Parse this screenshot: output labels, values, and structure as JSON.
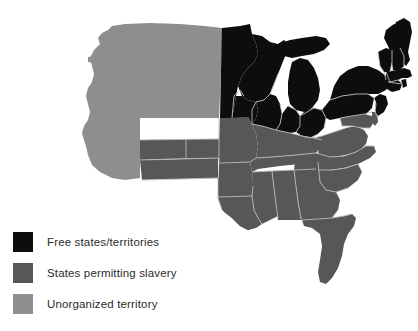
{
  "figure": {
    "kind": "thematic-map",
    "region": "eastern-united-states",
    "background_color": "#ffffff",
    "border_color": "#b9b9b9"
  },
  "legend": {
    "items": [
      {
        "key": "free",
        "label": "Free states/territories",
        "color": "#0d0d0d",
        "swatch_name": "legend-swatch-free-states"
      },
      {
        "key": "slave",
        "label": "States permitting slavery",
        "color": "#575757",
        "swatch_name": "legend-swatch-slave-states"
      },
      {
        "key": "unorganized",
        "label": "Unorganized territory",
        "color": "#8e8e8e",
        "swatch_name": "legend-swatch-unorganized-territory"
      }
    ]
  },
  "map_data": {
    "categories": [
      "Free states/territories",
      "States permitting slavery",
      "Unorganized territory"
    ],
    "colors": {
      "free": "#0d0d0d",
      "slave": "#575757",
      "unorganized": "#8e8e8e"
    },
    "regions": [
      {
        "name": "unorganized-territory-west",
        "category": "unorganized"
      },
      {
        "name": "minnesota-territory",
        "category": "free"
      },
      {
        "name": "wisconsin",
        "category": "free"
      },
      {
        "name": "michigan",
        "category": "free"
      },
      {
        "name": "iowa",
        "category": "free"
      },
      {
        "name": "illinois",
        "category": "free"
      },
      {
        "name": "indiana",
        "category": "free"
      },
      {
        "name": "ohio",
        "category": "free"
      },
      {
        "name": "pennsylvania",
        "category": "free"
      },
      {
        "name": "new-york",
        "category": "free"
      },
      {
        "name": "new-jersey",
        "category": "free"
      },
      {
        "name": "connecticut",
        "category": "free"
      },
      {
        "name": "rhode-island",
        "category": "free"
      },
      {
        "name": "massachusetts",
        "category": "free"
      },
      {
        "name": "vermont",
        "category": "free"
      },
      {
        "name": "new-hampshire",
        "category": "free"
      },
      {
        "name": "maine",
        "category": "free"
      },
      {
        "name": "missouri",
        "category": "slave"
      },
      {
        "name": "arkansas",
        "category": "slave"
      },
      {
        "name": "indian-territory",
        "category": "slave"
      },
      {
        "name": "texas",
        "category": "slave"
      },
      {
        "name": "louisiana",
        "category": "slave"
      },
      {
        "name": "mississippi",
        "category": "slave"
      },
      {
        "name": "alabama",
        "category": "slave"
      },
      {
        "name": "tennessee",
        "category": "slave"
      },
      {
        "name": "kentucky",
        "category": "slave"
      },
      {
        "name": "virginia",
        "category": "slave"
      },
      {
        "name": "maryland",
        "category": "slave"
      },
      {
        "name": "delaware",
        "category": "slave"
      },
      {
        "name": "north-carolina",
        "category": "slave"
      },
      {
        "name": "south-carolina",
        "category": "slave"
      },
      {
        "name": "georgia",
        "category": "slave"
      },
      {
        "name": "florida",
        "category": "slave"
      }
    ]
  }
}
